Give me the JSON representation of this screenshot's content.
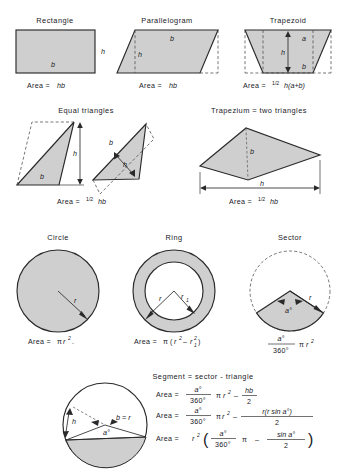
{
  "figure": {
    "fill_color": "#cfcfcf",
    "line_color": "#2a2a2a",
    "background": "#ffffff"
  },
  "row1": {
    "rectangle": {
      "title": "Rectangle",
      "label_h": "h",
      "label_b": "b",
      "formula_prefix": "Area =",
      "formula": "hb"
    },
    "parallelogram": {
      "title": "Parallelogram",
      "label_h": "h",
      "label_b": "b",
      "formula_prefix": "Area =",
      "formula": "hb"
    },
    "trapezoid": {
      "title": "Trapezoid",
      "label_h": "h",
      "label_a": "a",
      "label_b": "b",
      "formula_prefix": "Area =",
      "formula_frac": "1/2",
      "formula_rest": "h(a+b)"
    }
  },
  "row2": {
    "equal_triangles": {
      "title": "Equal triangles",
      "label_h_left": "h",
      "label_b_left": "b",
      "label_b_right": "b",
      "label_h_right": "h",
      "formula_prefix": "Area =",
      "formula_frac": "1/2",
      "formula_rest": "hb"
    },
    "trapezium": {
      "title": "Trapezium = two triangles",
      "label_b": "b",
      "label_h": "h",
      "formula_prefix": "Area =",
      "formula_frac": "1/2",
      "formula_rest": "hb"
    }
  },
  "row3": {
    "circle": {
      "title": "Circle",
      "label_r": "r",
      "formula_prefix": "Area =",
      "formula_pi": "π",
      "formula_var": "r",
      "formula_exp": "2",
      "formula_tail": "."
    },
    "ring": {
      "title": "Ring",
      "label_r": "r",
      "label_r1": "r",
      "label_r1_sub": "1",
      "formula_prefix": "Area =",
      "formula_pi": "π",
      "formula_open": "(",
      "formula_r": "r",
      "formula_exp": "2",
      "formula_minus": "–",
      "formula_r1": "r",
      "formula_r1_sub": "1",
      "formula_r1_exp": "2",
      "formula_close": ")"
    },
    "sector": {
      "title": "Sector",
      "label_r": "r",
      "label_angle": "a°",
      "formula_num": "a°",
      "formula_den": "360°",
      "formula_pi": "π",
      "formula_var": "r",
      "formula_exp": "2"
    }
  },
  "row4": {
    "segment": {
      "title": "Segment = sector - triangle",
      "label_h": "h",
      "label_b_eq_r": "b = r",
      "label_angle": "a°",
      "formulas": [
        {
          "prefix": "Area =",
          "num": "a°",
          "den": "360°",
          "pi": "π",
          "var": "r",
          "exp": "2",
          "minus": "–",
          "t_num": "hb",
          "t_den": "2"
        },
        {
          "prefix": "Area =",
          "num": "a°",
          "den": "360°",
          "pi": "π",
          "var": "r",
          "exp": "2",
          "minus": "–",
          "t_num": "r(r sin a°)",
          "t_den": "2"
        },
        {
          "prefix": "Area =",
          "lead_var": "r",
          "lead_exp": "2",
          "open": "(",
          "num": "a°",
          "den": "360°",
          "pi": "π",
          "minus": "–",
          "t_num": "sin a°",
          "t_den": "2",
          "close": ")"
        }
      ]
    }
  }
}
